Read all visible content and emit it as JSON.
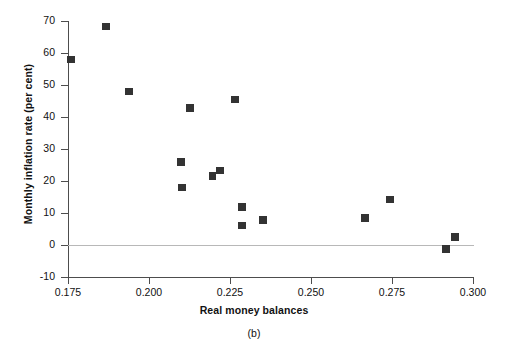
{
  "figure": {
    "caption": "(b)",
    "ylabel": "Monthly inflation rate (per cent)",
    "xlabel": "Real money balances"
  },
  "chart_data": {
    "type": "scatter",
    "title": "",
    "subtitle": "",
    "caption": "(b)",
    "xlabel": "Real money balances",
    "ylabel": "Monthly inflation rate (per cent)",
    "xlim": [
      0.175,
      0.3
    ],
    "ylim": [
      -10,
      70
    ],
    "xticks": [
      0.175,
      0.2,
      0.225,
      0.25,
      0.275,
      0.3
    ],
    "xtick_labels": [
      "0.175",
      "0.200",
      "0.225",
      "0.250",
      "0.275",
      "0.300"
    ],
    "yticks": [
      -10,
      0,
      10,
      20,
      30,
      40,
      50,
      60,
      70
    ],
    "ytick_labels": [
      "-10",
      "0",
      "10",
      "20",
      "30",
      "40",
      "50",
      "60",
      "70"
    ],
    "grid": false,
    "legend": null,
    "marker": "square",
    "marker_color": "#333333",
    "zero_reference_line": 0,
    "series": [
      {
        "name": "observations",
        "points": [
          {
            "x": 0.1759,
            "y": 58.0
          },
          {
            "x": 0.1868,
            "y": 68.3
          },
          {
            "x": 0.1938,
            "y": 48.0
          },
          {
            "x": 0.2099,
            "y": 25.9
          },
          {
            "x": 0.2102,
            "y": 17.9
          },
          {
            "x": 0.2127,
            "y": 42.8
          },
          {
            "x": 0.2196,
            "y": 21.5
          },
          {
            "x": 0.2219,
            "y": 23.3
          },
          {
            "x": 0.2265,
            "y": 45.5
          },
          {
            "x": 0.2287,
            "y": 11.9
          },
          {
            "x": 0.2287,
            "y": 6.1
          },
          {
            "x": 0.2352,
            "y": 7.8
          },
          {
            "x": 0.2666,
            "y": 8.5
          },
          {
            "x": 0.2744,
            "y": 14.2
          },
          {
            "x": 0.2917,
            "y": -1.3
          },
          {
            "x": 0.2944,
            "y": 2.5
          }
        ]
      }
    ]
  },
  "colors": {
    "marker": "#333333",
    "axis": "#4d4d4d",
    "zero_line": "#b8b8b8",
    "background": "#ffffff",
    "text": "#111111"
  }
}
